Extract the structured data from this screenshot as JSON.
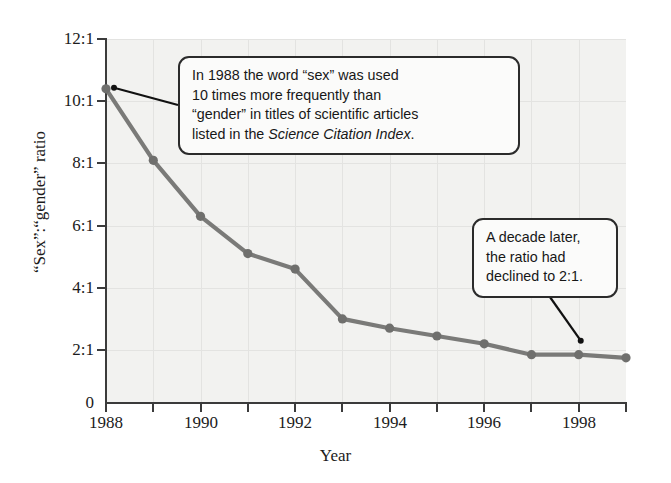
{
  "chart_data": {
    "type": "line",
    "title": "",
    "xlabel": "Year",
    "ylabel": "“Sex”:“gender” ratio",
    "x": [
      1988,
      1989,
      1990,
      1991,
      1992,
      1993,
      1994,
      1995,
      1996,
      1997,
      1998,
      1999
    ],
    "values": [
      10.4,
      8.1,
      6.3,
      5.1,
      4.6,
      3.0,
      2.7,
      2.45,
      2.2,
      1.85,
      1.85,
      1.75
    ],
    "series": [
      {
        "name": "“Sex”:“gender” ratio",
        "values": [
          10.4,
          8.1,
          6.3,
          5.1,
          4.6,
          3.0,
          2.7,
          2.45,
          2.2,
          1.85,
          1.85,
          1.75
        ]
      }
    ],
    "xlim": [
      1988,
      1999
    ],
    "ylim": [
      0,
      12
    ],
    "x_tick_labels": [
      "1988",
      "1990",
      "1992",
      "1994",
      "1996",
      "1998"
    ],
    "x_tick_values": [
      1988,
      1990,
      1992,
      1994,
      1996,
      1998
    ],
    "x_minor_ticks": [
      1989,
      1991,
      1993,
      1995,
      1997,
      1999
    ],
    "y_tick_labels": [
      "12:1",
      "10:1",
      "8:1",
      "6:1",
      "4:1",
      "2:1",
      "0"
    ],
    "y_tick_values": [
      12,
      10,
      8,
      6,
      4,
      2,
      0
    ],
    "grid": true,
    "legend": "none",
    "line_color": "#7a7a78",
    "marker_color": "#6f6f6d",
    "plot_background": "#f2f2f0",
    "axis_color": "#3b3b3b",
    "grid_color": "#e3e3e1",
    "annotations": [
      {
        "id": "sex-callout",
        "lines": [
          "In 1988 the word “sex” was used",
          "10 times more frequently than",
          "“gender” in titles of scientific articles",
          "listed in the "
        ],
        "italic_tail": "Science Citation Index",
        "tail_punct": ".",
        "points_to_year": 1988,
        "points_to_value": 10.4
      },
      {
        "id": "decade-callout",
        "lines": [
          "A decade later,",
          "the ratio had",
          "declined to 2:1."
        ],
        "italic_tail": "",
        "tail_punct": "",
        "points_to_year": 1998,
        "points_to_value": 1.85
      }
    ]
  },
  "axes": {
    "x_title": "Year",
    "y_title": "“Sex”:“gender” ratio"
  }
}
